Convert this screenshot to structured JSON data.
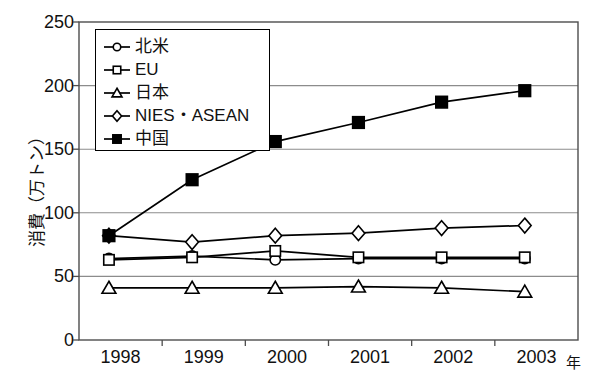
{
  "chart_data": {
    "type": "line",
    "title": "",
    "xlabel": "年",
    "ylabel": "消費（万トン）",
    "categories": [
      "1998",
      "1999",
      "2000",
      "2001",
      "2002",
      "2003"
    ],
    "ylim": [
      0,
      250
    ],
    "ytick_labels": [
      "0",
      "50",
      "100",
      "150",
      "200",
      "250"
    ],
    "ytick_values": [
      0,
      50,
      100,
      150,
      200,
      250
    ],
    "grid": "horizontal",
    "legend_position": "top-left-inside",
    "series": [
      {
        "name": "北米",
        "marker": "circle-open",
        "values": [
          64,
          66,
          63,
          64,
          64,
          64
        ]
      },
      {
        "name": "EU",
        "marker": "square-open",
        "values": [
          63,
          65,
          70,
          65,
          65,
          65
        ]
      },
      {
        "name": "日本",
        "marker": "triangle-open",
        "values": [
          41,
          41,
          41,
          42,
          41,
          38
        ]
      },
      {
        "name": "NIES・ASEAN",
        "marker": "diamond-open",
        "values": [
          82,
          77,
          82,
          84,
          88,
          90
        ]
      },
      {
        "name": "中国",
        "marker": "square-filled",
        "values": [
          82,
          126,
          156,
          171,
          187,
          196
        ]
      }
    ]
  },
  "axes": {
    "y_title": "消費（万トン）",
    "x_unit": "年"
  },
  "legend": {
    "items": [
      {
        "label": "北米"
      },
      {
        "label": "EU"
      },
      {
        "label": "日本"
      },
      {
        "label": "NIES・ASEAN"
      },
      {
        "label": "中国"
      }
    ]
  },
  "colors": {
    "line": "#000000",
    "marker_fill_open": "#ffffff",
    "marker_fill_solid": "#000000",
    "grid": "#8c8c8c",
    "axis": "#4d4d4d",
    "text": "#111111",
    "background": "#ffffff"
  }
}
